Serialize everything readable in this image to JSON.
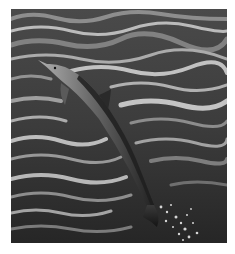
{
  "image": {
    "subject": "dolphin leaping out of ocean water",
    "style": "grayscale photograph",
    "colors": {
      "border": "#ffffff",
      "water_dark": "#2a2a2a",
      "water_mid": "#5a5a5a",
      "water_highlight": "#c8c8c8",
      "dolphin_back": "#2e2e2e",
      "dolphin_belly": "#a8a8a8",
      "splash": "#e8e8e8"
    }
  }
}
